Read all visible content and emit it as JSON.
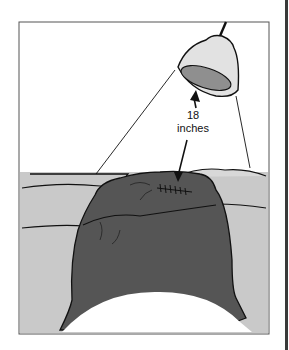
{
  "figure": {
    "annotation": {
      "line1": "18",
      "line2": "inches"
    },
    "colors": {
      "frame": "#555555",
      "bed": "#c9c9c9",
      "body": "#555555",
      "lamp_shade": "#e2e2e2",
      "lamp_inner": "#8f8f8f",
      "outline": "#111111",
      "background": "#ffffff"
    }
  }
}
